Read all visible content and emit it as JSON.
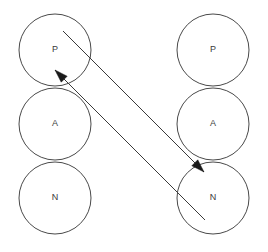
{
  "diagram": {
    "title": "",
    "background_color": "#ffffff",
    "stroke_color": "#4a4a4a",
    "label_color": "#3a3a3a",
    "arrow_color": "#3a3a3a",
    "columns": [
      {
        "name": "left-column",
        "center_x": 55,
        "nodes": [
          {
            "id": "left-p",
            "label": "P",
            "cx": 55,
            "cy": 50,
            "r": 36
          },
          {
            "id": "left-a",
            "label": "A",
            "cx": 55,
            "cy": 124,
            "r": 36
          },
          {
            "id": "left-n",
            "label": "N",
            "cx": 55,
            "cy": 198,
            "r": 36
          }
        ]
      },
      {
        "name": "right-column",
        "center_x": 213,
        "nodes": [
          {
            "id": "right-p",
            "label": "P",
            "cx": 213,
            "cy": 50,
            "r": 36
          },
          {
            "id": "right-a",
            "label": "A",
            "cx": 213,
            "cy": 124,
            "r": 36
          },
          {
            "id": "right-n",
            "label": "N",
            "cx": 213,
            "cy": 198,
            "r": 36
          }
        ]
      }
    ],
    "arrows": [
      {
        "id": "arrow-to-right-n",
        "from": "left-p",
        "to": "right-n",
        "x1": 63,
        "y1": 31,
        "x2": 204,
        "y2": 172,
        "head_at": "end"
      },
      {
        "id": "arrow-to-left-p",
        "from": "right-n",
        "to": "left-p",
        "x1": 205,
        "y1": 220,
        "x2": 55,
        "y2": 70,
        "head_at": "end"
      }
    ]
  }
}
